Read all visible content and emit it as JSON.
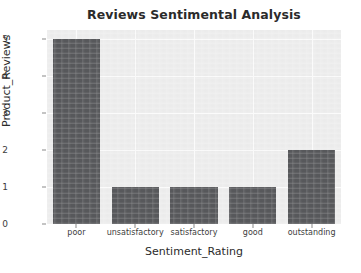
{
  "chart_data": {
    "type": "bar",
    "title": "Reviews Sentimental Analysis",
    "xlabel": "Sentiment_Rating",
    "ylabel": "Product_Reviews",
    "categories": [
      "poor",
      "unsatisfactory",
      "satisfactory",
      "good",
      "outstanding"
    ],
    "values": [
      5,
      1,
      1,
      1,
      2
    ],
    "yticks": [
      "0",
      "1",
      "2",
      "3",
      "4",
      "5"
    ],
    "ylim": [
      0,
      5.25
    ],
    "grid": true,
    "legend": "none",
    "bar_color": "#58595c",
    "plot_background": "#ededed",
    "gridline_color": "#fbfbfb",
    "figure_background": "#ffffff",
    "text_color": "#2b2b2b"
  }
}
